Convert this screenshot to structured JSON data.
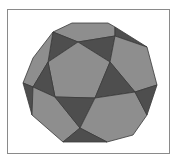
{
  "figure": {
    "frame_border_color": "#8a8a8a",
    "background_color": "#ffffff",
    "colors": {
      "pentagon_face": "#8e8e8e",
      "triangle_face": "#4e4e4e",
      "edge": "#3a3a3a"
    },
    "faces": [
      {
        "type": "pentagon",
        "shade": "light",
        "points": "53,32 72,23 108,23 115,27 115,36 78,42"
      },
      {
        "type": "triangle",
        "shade": "dark",
        "points": "53,32 78,42 48,62"
      },
      {
        "type": "triangle",
        "shade": "dark",
        "points": "78,42 115,36 110,62"
      },
      {
        "type": "triangle",
        "shade": "dark",
        "points": "115,27 147,47 115,36"
      },
      {
        "type": "pentagon",
        "shade": "light",
        "points": "78,42 110,62 95,98 55,97 48,62"
      },
      {
        "type": "pentagon",
        "shade": "light",
        "points": "115,36 147,47 157,85 135,92 110,62"
      },
      {
        "type": "pentagon",
        "shade": "light",
        "points": "33,58 53,32 48,62 33,87 23,83"
      },
      {
        "type": "triangle",
        "shade": "dark",
        "points": "48,62 55,97 33,87"
      },
      {
        "type": "triangle",
        "shade": "dark",
        "points": "110,62 135,92 95,98"
      },
      {
        "type": "triangle",
        "shade": "dark",
        "points": "23,83 33,87 32,115"
      },
      {
        "type": "pentagon",
        "shade": "light",
        "points": "33,87 55,97 80,128 63,142 32,115"
      },
      {
        "type": "triangle",
        "shade": "dark",
        "points": "55,97 95,98 80,128"
      },
      {
        "type": "pentagon",
        "shade": "light",
        "points": "95,98 135,92 147,115 133,135 107,142 80,128"
      },
      {
        "type": "triangle",
        "shade": "dark",
        "points": "157,85 147,115 135,92"
      },
      {
        "type": "triangle",
        "shade": "dark",
        "points": "80,128 107,142 63,142"
      }
    ]
  }
}
